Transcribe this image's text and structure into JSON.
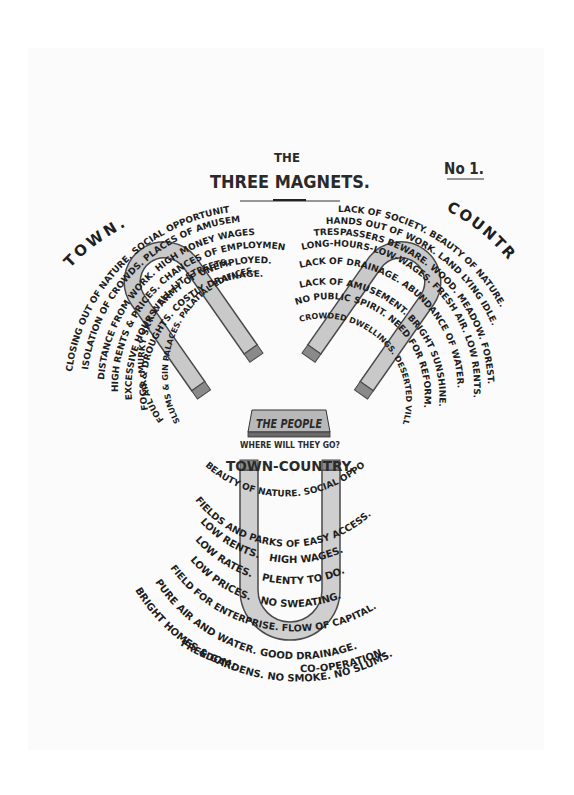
{
  "header": {
    "title_line1": "THE",
    "title_line2": "THREE MAGNETS.",
    "number": "No 1."
  },
  "colors": {
    "ink": "#1e1e1e",
    "magnet_fill": "#c9c9c9",
    "magnet_stroke": "#4a4a4a",
    "paper": "#fbfbfb"
  },
  "town": {
    "label": "TOWN.",
    "lines": [
      "CLOSING OUT OF NATURE. SOCIAL OPPORTUNITY.",
      "ISOLATION OF CROWDS. PLACES OF AMUSEMENT.",
      "DISTANCE FROM WORK. HIGH MONEY WAGES.",
      "HIGH RENTS & PRICES. CHANCES OF EMPLOYMENT.",
      "EXCESSIVE HOURS. ARMY OF UNEMPLOYED.",
      "FOGS & DROUGHTS. COSTLY DRAINAGE.",
      "FOUL AIR. MURKY SKY. WELL-LIT STREETS.",
      "SLUMS & GIN PALACES. PALATIAL EDIFICES."
    ]
  },
  "country": {
    "label": "COUNTRY.",
    "lines": [
      "LACK OF SOCIETY. BEAUTY OF NATURE.",
      "HANDS OUT OF WORK. LAND LYING IDLE.",
      "TRESPASSERS BEWARE. WOOD. MEADOW. FOREST.",
      "LONG-HOURS-LOW-WAGES. FRESH AIR. LOW RENTS.",
      "LACK OF DRAINAGE. ABUNDANCE OF WATER.",
      "LACK OF AMUSEMENT. BRIGHT SUNSHINE.",
      "NO PUBLIC SPIRIT. NEED FOR REFORM.",
      "CROWDED DWELLINGS. DESERTED VILLAGES."
    ]
  },
  "people": {
    "label": "THE PEOPLE",
    "question": "WHERE WILL THEY GO?"
  },
  "town_country": {
    "label": "TOWN-COUNTRY.",
    "lines": [
      "BEAUTY OF NATURE. SOCIAL OPPORTUNITY.",
      "FIELDS AND PARKS OF EASY ACCESS.",
      "LOW RENTS.   HIGH WAGES.",
      "LOW RATES.   PLENTY TO DO.",
      "LOW PRICES.   NO SWEATING.",
      "FIELD FOR ENTERPRISE. FLOW OF CAPITAL.",
      "PURE AIR AND WATER. GOOD DRAINAGE.",
      "BRIGHT HOMES & GARDENS. NO SMOKE. NO SLUMS.",
      "FREEDOM.",
      "CO-OPERATION."
    ]
  }
}
